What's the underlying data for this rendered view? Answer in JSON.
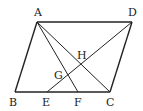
{
  "diagram": {
    "type": "geometry",
    "points": {
      "A": {
        "label": "A",
        "x": 37,
        "y": 22,
        "lx": 34,
        "ly": 16
      },
      "B": {
        "label": "B",
        "x": 15,
        "y": 92,
        "lx": 9,
        "ly": 106
      },
      "C": {
        "label": "C",
        "x": 110,
        "y": 92,
        "lx": 106,
        "ly": 106
      },
      "D": {
        "label": "D",
        "x": 132,
        "y": 22,
        "lx": 128,
        "ly": 16
      },
      "E": {
        "label": "E",
        "x": 47,
        "y": 92,
        "lx": 42,
        "ly": 106
      },
      "F": {
        "label": "F",
        "x": 78,
        "y": 92,
        "lx": 74,
        "ly": 106
      },
      "G": {
        "label": "G",
        "x": 67,
        "y": 75,
        "lx": 54,
        "ly": 79
      },
      "H": {
        "label": "H",
        "x": 85,
        "y": 61,
        "lx": 76,
        "ly": 59
      }
    },
    "segments": [
      "AB",
      "BC",
      "CD",
      "DA",
      "AC",
      "AF",
      "DE"
    ]
  }
}
